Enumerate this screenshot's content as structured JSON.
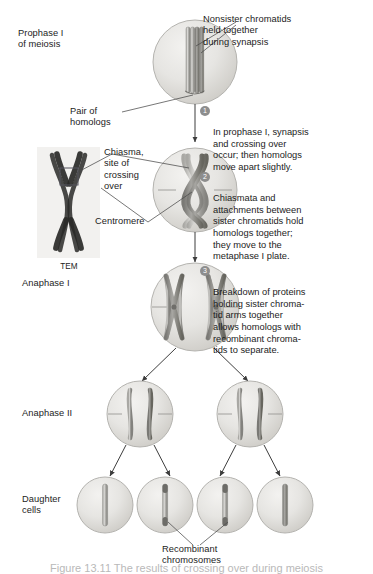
{
  "figure": {
    "type": "biology-process-diagram",
    "style": "grayscale textbook illustration"
  },
  "stage_labels": {
    "prophase": "Prophase I\nof meiosis",
    "anaphase1": "Anaphase I",
    "anaphase2": "Anaphase II",
    "daughter": "Daughter\ncells"
  },
  "pointer_labels": {
    "nonsister": "Nonsister chromatids\nheld together\nduring synapsis",
    "pair_homologs": "Pair of\nhomologs",
    "chiasma": "Chiasma,\nsite of\ncrossing\nover",
    "centromere": "Centromere",
    "recombinant": "Recombinant\nchromosomes"
  },
  "tem": {
    "caption": "TEM",
    "alt": "Transmission electron micrograph of paired homologous chromosomes joined at a chiasma"
  },
  "callouts": [
    {
      "number": "1",
      "text": "In prophase I, synapsis\nand crossing over\noccur; then homologs\nmove apart slightly."
    },
    {
      "number": "2",
      "text": "Chiasmata and\nattachments between\nsister chromatids hold\nhomologs together;\nthey move to the\nmetaphase I plate."
    },
    {
      "number": "3",
      "text": "Breakdown of proteins\nholding sister chroma-\ntid arms together\nallows homologs with\nrecombinant chroma-\ntids to separate."
    }
  ],
  "cells": {
    "prophase": {
      "contents": "one synapsed tetrad (four aligned chromatids)"
    },
    "metaphase": {
      "contents": "two homologs crossed at chiasma on metaphase plate"
    },
    "anaphase1": {
      "contents": "two X-shaped homologs separating, recombinant tips"
    },
    "anaphase2": [
      {
        "contents": "two sister chromatids separating"
      },
      {
        "contents": "two sister chromatids separating"
      }
    ],
    "daughter": [
      {
        "contents": "parental chromosome",
        "recombinant": "no"
      },
      {
        "contents": "recombinant chromosome",
        "recombinant": "yes"
      },
      {
        "contents": "recombinant chromosome",
        "recombinant": "yes"
      },
      {
        "contents": "parental chromosome",
        "recombinant": "no"
      }
    ]
  },
  "colors": {
    "cell_fill": "#e4e3e0",
    "cell_edge": "#b6b5b1",
    "chromatid_light": "#cfcecb",
    "chromatid_dark": "#8e8d89",
    "recombinant_dark": "#6d6c68",
    "leader_line": "#4a4a4a",
    "badge": "#8d8d8d",
    "text": "#1c1c1c"
  },
  "footer_cut": "Figure 13.11 The results of crossing over during meiosis"
}
